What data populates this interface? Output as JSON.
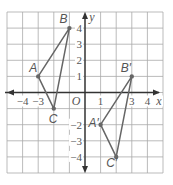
{
  "graph": {
    "grid": {
      "xmin": -5,
      "xmax": 5,
      "ymin": -5,
      "ymax": 5
    },
    "axis_labels": {
      "x": "x",
      "y": "y",
      "origin": "O"
    },
    "x_ticks": [
      {
        "value": -4,
        "label": "−4"
      },
      {
        "value": -3,
        "label": "−3"
      },
      {
        "value": 1,
        "label": "1"
      },
      {
        "value": 3,
        "label": "3"
      },
      {
        "value": 4,
        "label": "4"
      }
    ],
    "y_ticks": [
      {
        "value": 4,
        "label": "4"
      },
      {
        "value": 3,
        "label": "3"
      },
      {
        "value": 2,
        "label": "2"
      },
      {
        "value": 1,
        "label": "1"
      },
      {
        "value": -2,
        "label": "−2"
      },
      {
        "value": -3,
        "label": "−3"
      },
      {
        "value": -4,
        "label": "−4"
      }
    ],
    "triangles": [
      {
        "name": "ABC",
        "vertices": [
          {
            "label": "A",
            "x": -3,
            "y": 1
          },
          {
            "label": "B",
            "x": -1,
            "y": 4
          },
          {
            "label": "C",
            "x": -2,
            "y": -1
          }
        ]
      },
      {
        "name": "A'B'C'",
        "vertices": [
          {
            "label": "A′",
            "x": 1,
            "y": -2
          },
          {
            "label": "B′",
            "x": 3,
            "y": 1
          },
          {
            "label": "C′",
            "x": 2,
            "y": -4
          }
        ]
      }
    ],
    "colors": {
      "grid": "#aaaaaa",
      "axis": "#333333",
      "triangle": "#666666",
      "point": "#666666"
    }
  }
}
